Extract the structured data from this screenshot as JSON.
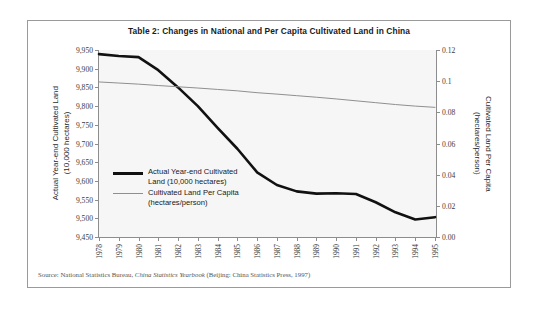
{
  "figure": {
    "title": "Table 2: Changes in National and Per Capita Cultivated Land in China",
    "source_prefix": "Source: National Statistics Bureau, ",
    "source_italic": "China Statistics Yearbook",
    "source_suffix": " (Beijing: China Statistics Press, 1997)"
  },
  "axes": {
    "left_title": "Actual Year-end Cultivated Land\n(10,000 hectares)",
    "right_title": "Cultivated Land Per Capita\n(hectares/person)",
    "left_ticks": [
      "9,950",
      "9,900",
      "9,850",
      "9,800",
      "9,750",
      "9,700",
      "9,650",
      "9,600",
      "9,550",
      "9,500",
      "9,450"
    ],
    "right_ticks": [
      "0.12",
      "0.1",
      "0.08",
      "0.06",
      "0.04",
      "0.02",
      "0.00"
    ]
  },
  "legend": {
    "items": [
      {
        "label": "Actual Year-end Cultivated\nLand (10,000 hectares)",
        "swatch": "thick-black-line",
        "color": "#111111"
      },
      {
        "label": "Cultivated Land Per Capita\n(hectares/person)",
        "swatch": "thin-gray-line",
        "color": "#8f8f8f"
      }
    ]
  },
  "chart_data": {
    "type": "line",
    "title": "Table 2: Changes in National and Per Capita Cultivated Land in China",
    "xlabel": "",
    "grid": false,
    "legend_position": "inside-left-middle",
    "categories": [
      "1978",
      "1979",
      "1980",
      "1981",
      "1982",
      "1983",
      "1984",
      "1985",
      "1986",
      "1987",
      "1988",
      "1989",
      "1990",
      "1991",
      "1992",
      "1993",
      "1994",
      "1995"
    ],
    "x": [
      1978,
      1979,
      1980,
      1981,
      1982,
      1983,
      1984,
      1985,
      1986,
      1987,
      1988,
      1989,
      1990,
      1991,
      1992,
      1993,
      1994,
      1995
    ],
    "series": [
      {
        "name": "Actual Year-end Cultivated Land (10,000 hectares)",
        "axis": "left",
        "ylabel": "Actual Year-end Cultivated Land (10,000 hectares)",
        "ylim": [
          9450,
          9950
        ],
        "color": "#111111",
        "linewidth": 2.6,
        "values": [
          9939,
          9934,
          9931,
          9896,
          9850,
          9800,
          9742,
          9686,
          9623,
          9589,
          9572,
          9566,
          9567,
          9565,
          9543,
          9516,
          9497,
          9503
        ]
      },
      {
        "name": "Cultivated Land Per Capita (hectares/person)",
        "axis": "right",
        "ylabel": "Cultivated Land Per Capita (hectares/person)",
        "ylim": [
          0.0,
          0.12
        ],
        "color": "#8f8f8f",
        "linewidth": 1.0,
        "values": [
          0.0995,
          0.0988,
          0.0981,
          0.0972,
          0.0964,
          0.0956,
          0.0947,
          0.0938,
          0.0926,
          0.0917,
          0.0907,
          0.0897,
          0.0886,
          0.0874,
          0.0862,
          0.085,
          0.084,
          0.0832
        ]
      }
    ]
  }
}
